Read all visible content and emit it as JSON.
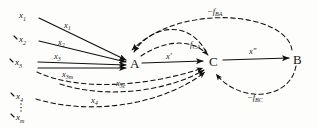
{
  "diagram": {
    "nodes": [
      {
        "id": "A",
        "label": "A",
        "x": 133,
        "y": 62
      },
      {
        "id": "C",
        "label": "C",
        "x": 213,
        "y": 60
      },
      {
        "id": "B",
        "label": "B",
        "x": 297,
        "y": 58
      }
    ],
    "sources": [
      {
        "id": "x1",
        "label": "x",
        "sub": "1",
        "x": 22,
        "y": 15
      },
      {
        "id": "x2",
        "label": "x",
        "sub": "2",
        "x": 22,
        "y": 39
      },
      {
        "id": "x3",
        "label": "x",
        "sub": "3",
        "x": 18,
        "y": 61
      },
      {
        "id": "x4",
        "label": "x",
        "sub": "4",
        "x": 20,
        "y": 96
      },
      {
        "id": "xm",
        "label": "x",
        "sub": "m",
        "x": 20,
        "y": 117
      }
    ],
    "edge_labels": [
      {
        "id": "x1-edge",
        "label": "x",
        "sub": "1",
        "x": 66,
        "y": 25
      },
      {
        "id": "x2-edge",
        "label": "x",
        "sub": "2",
        "x": 60,
        "y": 42
      },
      {
        "id": "x3-edge",
        "label": "x",
        "sub": "3",
        "x": 56,
        "y": 56
      },
      {
        "id": "x3m-edge",
        "label": "x",
        "sub": "3m",
        "x": 64,
        "y": 74
      },
      {
        "id": "x3c-edge",
        "label": "x",
        "sub": "3c",
        "x": 118,
        "y": 83
      },
      {
        "id": "x4-edge",
        "label": "x",
        "sub": "4",
        "x": 93,
        "y": 100
      },
      {
        "id": "xprime-edge",
        "label": "x'",
        "sub": "",
        "x": 168,
        "y": 56
      },
      {
        "id": "xdoubleprime-edge",
        "label": "x″",
        "sub": "",
        "x": 251,
        "y": 51
      },
      {
        "id": "fca-edge",
        "label": "f",
        "sub": "CA",
        "x": 192,
        "y": 44
      },
      {
        "id": "fba-edge",
        "label": "−f",
        "sub": "BA",
        "x": 209,
        "y": 11
      },
      {
        "id": "fbc-edge",
        "label": "−f",
        "sub": "BC",
        "x": 249,
        "y": 97
      }
    ],
    "paths": {
      "x1_to_A": "M 39,18 L 126,60",
      "x2_to_A": "M 39,41 L 126,62",
      "x3_to_A": "M 38,62 L 126,65",
      "x3_lower_to_A": "M 38,68 L 126,68",
      "A_to_C": "M 142,63 L 203,61",
      "C_to_B": "M 223,60 L 289,58",
      "x3m_to_C": "M 37,72 C 80,92 150,86 203,68",
      "x3c_to_C": "M 60,84 C 110,100 170,90 204,70",
      "x4_to_C": "M 36,99 C 100,118 170,100 205,72",
      "fba_C_to_A": "M 206,52 C 190,20 152,24 134,52",
      "fba_big_B_to_A": "M 292,50 C 286,12 180,2 132,50",
      "fca_A_to_C": "M 141,56 C 165,40 192,38 208,55",
      "fbc_B_to_C": "M 296,66 C 290,100 240,104 216,74"
    }
  }
}
